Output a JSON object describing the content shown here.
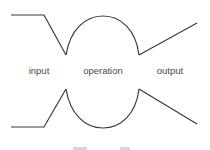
{
  "diagram": {
    "labels": {
      "input": "input",
      "operation": "operation",
      "output": "output"
    },
    "colors": {
      "stroke": "#3a3a3a",
      "label": "#4a4a4a",
      "background": "#ffffff"
    },
    "caption": {
      "visible": "truncated"
    }
  }
}
